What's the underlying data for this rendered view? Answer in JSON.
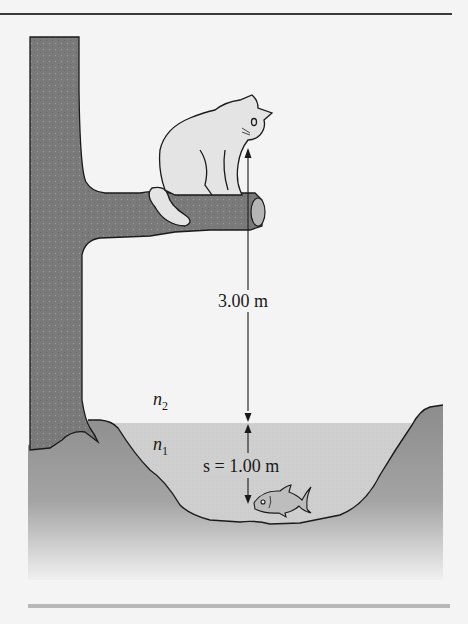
{
  "figure": {
    "labels": {
      "height_label": "3.00 m",
      "medium_above": "n",
      "medium_above_sub": "2",
      "medium_below": "n",
      "medium_below_sub": "1",
      "depth_label": "s = 1.00 m"
    },
    "colors": {
      "background": "#f4f4f4",
      "tree": "#7a7a7a",
      "ground": "#8e8e8e",
      "water": "#cfcfcf",
      "cat": "#e4e4e4",
      "outline": "#1a1a1a",
      "fish": "#bdbdbd"
    }
  }
}
